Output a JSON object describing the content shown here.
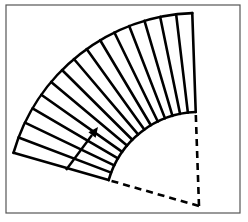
{
  "figure": {
    "frame": {
      "x": 6,
      "y": 5,
      "width": 234,
      "height": 208,
      "stroke": "#555555"
    },
    "sector": {
      "center": [
        199,
        206
      ],
      "inner_radius": 94,
      "outer_radius": 193,
      "start_angle_deg": 92,
      "end_angle_deg": 164,
      "divisions": 15,
      "stroke": "#000000",
      "line_width": 2.6
    },
    "dashed_radii": {
      "dash": "7,5",
      "stroke": "#000000"
    },
    "arrow": {
      "from": [
        66,
        170
      ],
      "to": [
        98,
        127
      ],
      "stroke": "#000000"
    }
  },
  "caption": {
    "text": ""
  }
}
